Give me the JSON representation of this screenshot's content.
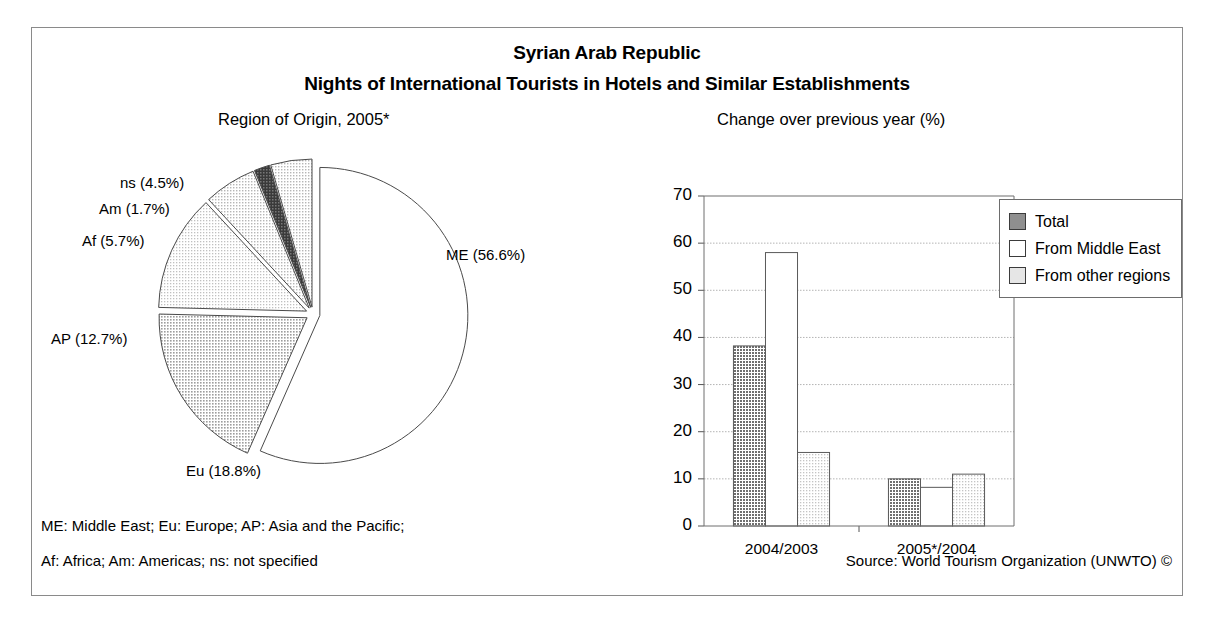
{
  "figure": {
    "title_line1": "Syrian Arab Republic",
    "title_line2": "Nights of International Tourists in Hotels and Similar Establishments",
    "pie_panel_title": "Region of Origin, 2005*",
    "bar_panel_title": "Change over previous year (%)",
    "footnote_line1": "ME: Middle East; Eu: Europe; AP: Asia and the Pacific;",
    "footnote_line2": "Af: Africa; Am: Americas; ns: not specified",
    "source": "Source: World Tourism Organization (UNWTO) ©"
  },
  "colors": {
    "frame": "#8a8a8a",
    "text": "#000000",
    "slice_me": "#ffffff",
    "slice_eu": "#c9c9c9",
    "slice_ap": "#e2e2e2",
    "slice_af": "#d8d8d8",
    "slice_am": "#6b6b6b",
    "slice_ns": "#dcdcdc",
    "bar_total": "#8f8f8f",
    "bar_middle_east": "#ffffff",
    "bar_other": "#e0e0e0",
    "gridline": "#b4b4b4"
  },
  "chart_data": [
    {
      "type": "pie",
      "title": "Region of Origin, 2005*",
      "unit": "%",
      "start_angle_deg": 0,
      "direction": "clockwise",
      "exploded": true,
      "labels": [
        "ME",
        "Eu",
        "AP",
        "Af",
        "Am",
        "ns"
      ],
      "values": [
        56.6,
        18.8,
        12.7,
        5.7,
        1.7,
        4.5
      ],
      "slices": [
        {
          "key": "me",
          "label": "ME",
          "value": 56.6,
          "display": "ME (56.6%)",
          "fill": "#ffffff"
        },
        {
          "key": "eu",
          "label": "Eu",
          "value": 18.8,
          "display": "Eu (18.8%)",
          "fill": "#c9c9c9"
        },
        {
          "key": "ap",
          "label": "AP",
          "value": 12.7,
          "display": "AP (12.7%)",
          "fill": "#e2e2e2"
        },
        {
          "key": "af",
          "label": "Af",
          "value": 5.7,
          "display": "Af (5.7%)",
          "fill": "#d8d8d8"
        },
        {
          "key": "am",
          "label": "Am",
          "value": 1.7,
          "display": "Am (1.7%)",
          "fill": "#6b6b6b"
        },
        {
          "key": "ns",
          "label": "ns",
          "value": 4.5,
          "display": "ns (4.5%)",
          "fill": "#dcdcdc"
        }
      ]
    },
    {
      "type": "bar",
      "title": "Change over previous year (%)",
      "xlabel": "",
      "ylabel": "",
      "ylim": [
        0,
        70
      ],
      "yticks": [
        0,
        10,
        20,
        30,
        40,
        50,
        60,
        70
      ],
      "grid": true,
      "legend_position": "right",
      "categories": [
        "2004/2003",
        "2005*/2004"
      ],
      "series": [
        {
          "name": "Total",
          "values": [
            38.2,
            10.0
          ],
          "fill": "#8f8f8f"
        },
        {
          "name": "From Middle East",
          "values": [
            58.0,
            8.2
          ],
          "fill": "#ffffff"
        },
        {
          "name": "From other regions",
          "values": [
            15.6,
            11.0
          ],
          "fill": "#e0e0e0"
        }
      ]
    }
  ],
  "legend": {
    "items": [
      {
        "label": "Total",
        "swatch": "#8f8f8f"
      },
      {
        "label": "From Middle East",
        "swatch": "#ffffff"
      },
      {
        "label": "From other regions",
        "swatch": "#e0e0e0"
      }
    ]
  },
  "pie_labels": [
    {
      "key": "ns",
      "text": "ns (4.5%)",
      "x": 88,
      "y": 38
    },
    {
      "key": "am",
      "text": "Am (1.7%)",
      "x": 67,
      "y": 64
    },
    {
      "key": "af",
      "text": "Af (5.7%)",
      "x": 50,
      "y": 96
    },
    {
      "key": "ap",
      "text": "AP (12.7%)",
      "x": 19,
      "y": 194
    },
    {
      "key": "eu",
      "text": "Eu (18.8%)",
      "x": 154,
      "y": 326
    },
    {
      "key": "me",
      "text": "ME (56.6%)",
      "x": 414,
      "y": 110
    }
  ],
  "axis": {
    "ytick_labels": [
      "70",
      "60",
      "50",
      "40",
      "30",
      "20",
      "10",
      "0"
    ],
    "xtick_labels": [
      "2004/2003",
      "2005*/2004"
    ]
  }
}
